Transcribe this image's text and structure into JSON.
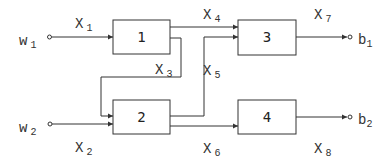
{
  "diagram": {
    "blocks": [
      {
        "id": "1",
        "label": "1"
      },
      {
        "id": "2",
        "label": "2"
      },
      {
        "id": "3",
        "label": "3"
      },
      {
        "id": "4",
        "label": "4"
      }
    ],
    "inputs": [
      {
        "base": "w",
        "sub": "1"
      },
      {
        "base": "w",
        "sub": "2"
      }
    ],
    "outputs": [
      {
        "base": "b",
        "sub": "1"
      },
      {
        "base": "b",
        "sub": "2"
      }
    ],
    "signals": [
      {
        "base": "X",
        "sub": "1"
      },
      {
        "base": "X",
        "sub": "2"
      },
      {
        "base": "X",
        "sub": "3"
      },
      {
        "base": "X",
        "sub": "4"
      },
      {
        "base": "X",
        "sub": "5"
      },
      {
        "base": "X",
        "sub": "6"
      },
      {
        "base": "X",
        "sub": "7"
      },
      {
        "base": "X",
        "sub": "8"
      }
    ]
  }
}
